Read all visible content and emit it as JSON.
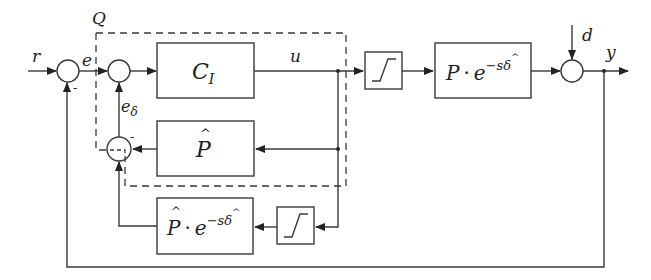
{
  "diagram": {
    "type": "control-block-diagram",
    "signals": {
      "r": "r",
      "e": "e",
      "u": "u",
      "e_delta_base": "e",
      "e_delta_sub": "δ",
      "d": "d",
      "y": "y",
      "q": "Q"
    },
    "blocks": {
      "controller": {
        "main": "C",
        "sub": "I"
      },
      "model": {
        "main": "P",
        "hat": "^"
      },
      "saturation_top": {
        "kind": "saturation"
      },
      "plant": {
        "main": "P",
        "dot": "·",
        "exp_base": "e",
        "exp": "−sδ",
        "exp_hat": "^"
      },
      "model_delay": {
        "main": "P",
        "hat": "^",
        "dot": "·",
        "exp_base": "e",
        "exp": "−sδ",
        "exp_hat": "^"
      },
      "saturation_bottom": {
        "kind": "saturation"
      }
    },
    "summing_junctions": [
      {
        "id": "sum-error",
        "signs": "+ , −"
      },
      {
        "id": "sum-controller-input",
        "signs": "+ , +"
      },
      {
        "id": "sum-model-diff",
        "signs": "− , +"
      },
      {
        "id": "sum-disturbance",
        "signs": "+ , +"
      }
    ],
    "minus_sign": "-",
    "colors": {
      "line": "#3a3a3a",
      "background": "#ffffff",
      "text": "#222222"
    }
  }
}
